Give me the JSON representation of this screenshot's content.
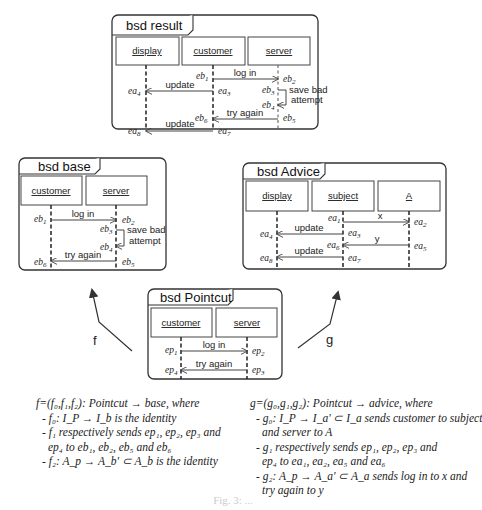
{
  "diagrams": {
    "result": {
      "title": "bsd result",
      "lifelines": [
        "display",
        "customer",
        "server"
      ],
      "messages": [
        {
          "label": "log in",
          "from": "customer",
          "to": "server",
          "src_event": "eb1",
          "dst_event": "eb2"
        },
        {
          "label": "update",
          "from": "customer",
          "to": "display",
          "src_event": "ea3",
          "dst_event": "ea4"
        },
        {
          "label": "save bad attempt",
          "from": "server",
          "to": "server",
          "src_event": "eb3",
          "dst_event": "eb4"
        },
        {
          "label": "try again",
          "from": "server",
          "to": "customer",
          "src_event": "eb5",
          "dst_event": "eb6"
        },
        {
          "label": "update",
          "from": "customer",
          "to": "display",
          "src_event": "ea7",
          "dst_event": "ea8"
        }
      ],
      "events": {
        "eb1": [
          "eb",
          "1"
        ],
        "eb2": [
          "eb",
          "2"
        ],
        "eb3": [
          "eb",
          "3"
        ],
        "eb4": [
          "eb",
          "4"
        ],
        "eb5": [
          "eb",
          "5"
        ],
        "eb6": [
          "eb",
          "6"
        ],
        "ea3": [
          "ea",
          "3"
        ],
        "ea4": [
          "ea",
          "4"
        ],
        "ea7": [
          "ea",
          "7"
        ],
        "ea8": [
          "ea",
          "8"
        ]
      },
      "self_label_line1": "save bad",
      "self_label_line2": "attempt"
    },
    "base": {
      "title": "bsd base",
      "lifelines": [
        "customer",
        "server"
      ],
      "messages": [
        {
          "label": "log in",
          "from": "customer",
          "to": "server",
          "src_event": "eb1",
          "dst_event": "eb2"
        },
        {
          "label": "save bad attempt",
          "from": "server",
          "to": "server",
          "src_event": "eb3",
          "dst_event": "eb4"
        },
        {
          "label": "try again",
          "from": "server",
          "to": "customer",
          "src_event": "eb5",
          "dst_event": "eb6"
        }
      ],
      "events": {
        "eb1": [
          "eb",
          "1"
        ],
        "eb2": [
          "eb",
          "2"
        ],
        "eb3": [
          "eb",
          "3"
        ],
        "eb4": [
          "eb",
          "4"
        ],
        "eb5": [
          "eb",
          "5"
        ],
        "eb6": [
          "eb",
          "6"
        ]
      },
      "self_label_line1": "save bad",
      "self_label_line2": "attempt"
    },
    "advice": {
      "title": "bsd Advice",
      "lifelines": [
        "display",
        "subject",
        "A"
      ],
      "messages": [
        {
          "label": "x",
          "from": "subject",
          "to": "A",
          "src_event": "ea1",
          "dst_event": "ea2"
        },
        {
          "label": "update",
          "from": "subject",
          "to": "display",
          "src_event": "ea3",
          "dst_event": "ea4"
        },
        {
          "label": "y",
          "from": "A",
          "to": "subject",
          "src_event": "ea5",
          "dst_event": "ea6"
        },
        {
          "label": "update",
          "from": "subject",
          "to": "display",
          "src_event": "ea7",
          "dst_event": "ea8"
        }
      ],
      "events": {
        "ea1": [
          "ea",
          "1"
        ],
        "ea2": [
          "ea",
          "2"
        ],
        "ea3": [
          "ea",
          "3"
        ],
        "ea4": [
          "ea",
          "4"
        ],
        "ea5": [
          "ea",
          "5"
        ],
        "ea6": [
          "ea",
          "6"
        ],
        "ea7": [
          "ea",
          "7"
        ],
        "ea8": [
          "ea",
          "8"
        ]
      }
    },
    "pointcut": {
      "title": "bsd Pointcut",
      "lifelines": [
        "customer",
        "server"
      ],
      "messages": [
        {
          "label": "log in",
          "from": "customer",
          "to": "server",
          "src_event": "ep1",
          "dst_event": "ep2"
        },
        {
          "label": "try again",
          "from": "server",
          "to": "customer",
          "src_event": "ep3",
          "dst_event": "ep4"
        }
      ],
      "events": {
        "ep1": [
          "ep",
          "1"
        ],
        "ep2": [
          "ep",
          "2"
        ],
        "ep3": [
          "ep",
          "3"
        ],
        "ep4": [
          "ep",
          "4"
        ]
      }
    }
  },
  "morphisms": {
    "f_label": "f",
    "g_label": "g"
  },
  "text": {
    "f": {
      "head": "f=(f₀,f₁,f₂): Pointcut → base, where",
      "items": [
        "- f₀: I_P → I_b is the identity",
        "- f₁ respectively sends ep₁, ep₂, ep₃ and",
        "ep₄ to eb₁, eb₂, eb₅ and eb₆",
        "- f₂: A_p → A_b' ⊂ A_b  is the identity"
      ]
    },
    "g": {
      "head": "g=(g₀,g₁,g₂): Pointcut → advice, where",
      "items": [
        "- g₀: I_P → I_a' ⊂ I_a  sends customer to subject",
        "and server to A",
        "- g₁ respectively sends ep₁, ep₂, ep₃ and",
        "ep₄ to ea₁, ea₂, ea₅ and ea₆",
        "- g₂: A_p → A_a' ⊂ A_a  sends log in to x and",
        "try again to y"
      ]
    }
  },
  "caption": "Fig. 3: ..."
}
